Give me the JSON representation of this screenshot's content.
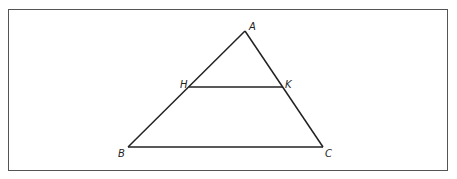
{
  "diagram": {
    "type": "triangle-with-parallel-segment",
    "stroke_color": "#222222",
    "frame_color": "#555555",
    "points": {
      "A": {
        "label": "A",
        "x": 245,
        "y": 31,
        "label_x": 249,
        "label_y": 30
      },
      "H": {
        "label": "H",
        "x": 189,
        "y": 87,
        "label_x": 180,
        "label_y": 88
      },
      "K": {
        "label": "K",
        "x": 283,
        "y": 87,
        "label_x": 285,
        "label_y": 88
      },
      "B": {
        "label": "B",
        "x": 128,
        "y": 147,
        "label_x": 118,
        "label_y": 157
      },
      "C": {
        "label": "C",
        "x": 323,
        "y": 147,
        "label_x": 325,
        "label_y": 157
      }
    },
    "segments": [
      {
        "from": "A",
        "to": "B"
      },
      {
        "from": "A",
        "to": "C"
      },
      {
        "from": "B",
        "to": "C"
      },
      {
        "from": "H",
        "to": "K"
      }
    ]
  }
}
